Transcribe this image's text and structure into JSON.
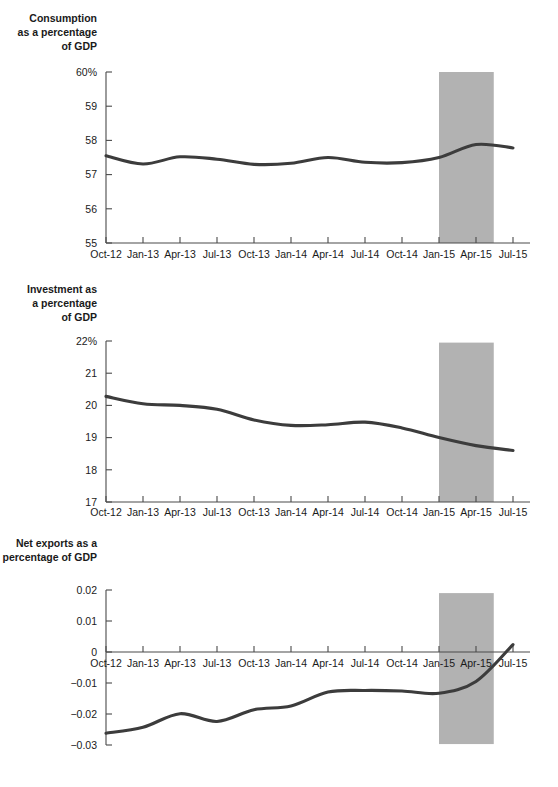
{
  "chart_data": [
    {
      "id": "consumption",
      "type": "line",
      "title": "",
      "ylabel_lines": [
        "Consumption",
        "as a percentage",
        "of GDP"
      ],
      "xlabel": "",
      "ylim": [
        55,
        60
      ],
      "yticks": [
        60,
        59,
        58,
        57,
        56,
        55
      ],
      "ytick_labels": [
        "60%",
        "59",
        "58",
        "57",
        "56",
        "55"
      ],
      "categories": [
        "Oct-12",
        "Jan-13",
        "Apr-13",
        "Jul-13",
        "Oct-13",
        "Jan-14",
        "Apr-14",
        "Jul-14",
        "Oct-14",
        "Jan-15",
        "Apr-15",
        "Jul-15"
      ],
      "values": [
        57.55,
        57.31,
        57.52,
        57.45,
        57.3,
        57.33,
        57.5,
        57.36,
        57.35,
        57.5,
        57.88,
        57.78
      ],
      "grid": false,
      "legend": "none",
      "shaded_band": {
        "from": "Jan-15",
        "to": "Jun-15",
        "color": "#b2b2b2",
        "top_value": 60.0,
        "bottom_value": 55.0
      }
    },
    {
      "id": "investment",
      "type": "line",
      "title": "",
      "ylabel_lines": [
        "Investment as",
        "a percentage",
        "of GDP"
      ],
      "xlabel": "",
      "ylim": [
        17,
        22
      ],
      "yticks": [
        22,
        21,
        20,
        19,
        18,
        17
      ],
      "ytick_labels": [
        "22%",
        "21",
        "20",
        "19",
        "18",
        "17"
      ],
      "categories": [
        "Oct-12",
        "Jan-13",
        "Apr-13",
        "Jul-13",
        "Oct-13",
        "Jan-14",
        "Apr-14",
        "Jul-14",
        "Oct-14",
        "Jan-15",
        "Apr-15",
        "Jul-15"
      ],
      "values": [
        20.28,
        20.05,
        20.0,
        19.88,
        19.55,
        19.38,
        19.4,
        19.48,
        19.3,
        19.0,
        18.75,
        18.6
      ],
      "grid": false,
      "legend": "none",
      "shaded_band": {
        "from": "Jan-15",
        "to": "Jun-15",
        "color": "#b2b2b2",
        "top_value": 21.95,
        "bottom_value": 17.0
      }
    },
    {
      "id": "net-exports",
      "type": "line",
      "title": "",
      "ylabel_lines": [
        "Net exports as a",
        "percentage of GDP"
      ],
      "xlabel": "",
      "ylim": [
        -0.03,
        0.02
      ],
      "yticks": [
        0.02,
        0.01,
        0,
        -0.01,
        -0.02,
        -0.03
      ],
      "ytick_labels": [
        "0.02",
        "0.01",
        "0",
        "−0.01",
        "−0.02",
        "−0.03"
      ],
      "categories": [
        "Oct-12",
        "Jan-13",
        "Apr-13",
        "Jul-13",
        "Oct-13",
        "Jan-14",
        "Apr-14",
        "Jul-14",
        "Oct-14",
        "Jan-15",
        "Apr-15",
        "Jul-15"
      ],
      "values": [
        -0.0262,
        -0.0243,
        -0.0199,
        -0.0224,
        -0.0186,
        -0.0174,
        -0.0129,
        -0.0124,
        -0.0126,
        -0.0133,
        -0.0095,
        0.0024
      ],
      "grid": false,
      "legend": "none",
      "zero_axis_value": 0,
      "shaded_band": {
        "from": "Jan-15",
        "to": "Jun-15",
        "color": "#b2b2b2",
        "top_value": 0.019,
        "bottom_value": -0.0297
      }
    }
  ]
}
